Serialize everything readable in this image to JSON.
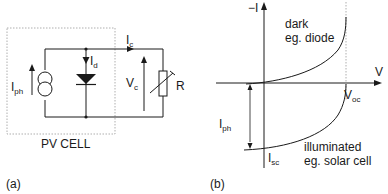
{
  "panel_a": {
    "caption": "(a)",
    "box_label": "PV CELL",
    "labels": {
      "iph": {
        "main": "I",
        "sub": "ph"
      },
      "id": {
        "main": "I",
        "sub": "d"
      },
      "ic": {
        "main": "I",
        "sub": "c"
      },
      "vc": {
        "main": "V",
        "sub": "c"
      },
      "r": "R"
    },
    "components": [
      "current-source",
      "diode",
      "variable-resistor"
    ]
  },
  "panel_b": {
    "caption": "(b)",
    "axis_y_label": "−I",
    "axis_x_label": "V",
    "curves": [
      {
        "name": "dark",
        "label_line1": "dark",
        "label_line2": "eg. diode"
      },
      {
        "name": "illuminated",
        "label_line1": "illuminated",
        "label_line2": "eg. solar cell"
      }
    ],
    "labels": {
      "voc": {
        "main": "V",
        "sub": "oc"
      },
      "isc": {
        "main": "I",
        "sub": "sc"
      },
      "iph": {
        "main": "I",
        "sub": "ph"
      }
    }
  },
  "colors": {
    "line": "#1a1a1a",
    "dotted": "#9a9a9a"
  }
}
